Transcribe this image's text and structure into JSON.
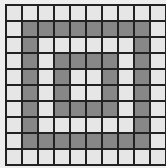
{
  "grid": {
    "rows": 10,
    "cols": 10,
    "colors": {
      "filled": "#878787",
      "empty": "#e6e6e6",
      "line": "#222222",
      "background": "#eeeeee"
    },
    "cells": [
      [
        0,
        0,
        0,
        0,
        0,
        0,
        0,
        0,
        0,
        0
      ],
      [
        0,
        1,
        1,
        1,
        1,
        1,
        1,
        1,
        1,
        0
      ],
      [
        0,
        1,
        0,
        0,
        0,
        0,
        0,
        0,
        1,
        0
      ],
      [
        0,
        1,
        0,
        1,
        1,
        1,
        1,
        0,
        1,
        0
      ],
      [
        0,
        1,
        0,
        1,
        0,
        0,
        1,
        0,
        1,
        0
      ],
      [
        0,
        1,
        0,
        1,
        0,
        0,
        1,
        0,
        1,
        0
      ],
      [
        0,
        1,
        0,
        1,
        1,
        1,
        1,
        0,
        1,
        0
      ],
      [
        0,
        1,
        0,
        0,
        0,
        0,
        0,
        0,
        1,
        0
      ],
      [
        0,
        1,
        1,
        1,
        1,
        1,
        1,
        1,
        1,
        0
      ],
      [
        0,
        0,
        0,
        0,
        0,
        0,
        0,
        0,
        0,
        0
      ]
    ]
  }
}
